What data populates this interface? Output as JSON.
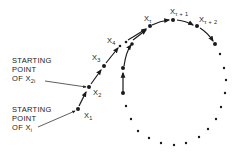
{
  "diagram": {
    "type": "rho-shaped sequence (cycle detection)",
    "labels": {
      "x1": {
        "base": "X",
        "sub": "1"
      },
      "x2": {
        "base": "X",
        "sub": "2"
      },
      "x3": {
        "base": "X",
        "sub": "3"
      },
      "x4": {
        "base": "X",
        "sub": "4"
      },
      "xt": {
        "base": "X",
        "sub": "τ"
      },
      "xt1": {
        "base": "X",
        "sub": "τ + 1"
      },
      "xt2": {
        "base": "X",
        "sub": "τ + 2"
      }
    },
    "annotations": {
      "start_x2i": {
        "line1": "STARTING",
        "line2": "POINT",
        "line3_prefix": "OF X",
        "line3_sub": "2i"
      },
      "start_xi": {
        "line1": "STARTING",
        "line2": "POINT",
        "line3_prefix": "OF X",
        "line3_sub": "i"
      }
    },
    "colors": {
      "ink": "#1a1a1a",
      "background": "#ffffff"
    }
  }
}
